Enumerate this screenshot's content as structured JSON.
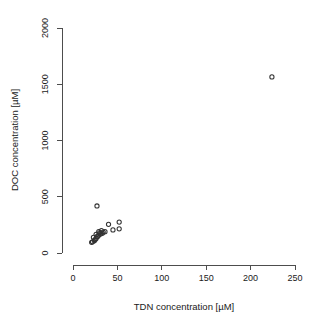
{
  "figure": {
    "background_color": "#ffffff",
    "point_color": "#333333",
    "axis_color": "#4d4d4d",
    "text_color": "#1a1a1a"
  },
  "chart_data": {
    "type": "scatter",
    "title": "",
    "subtitle": "",
    "xlabel": "TDN concentration [µM]",
    "ylabel": "DOC concentration [µM]",
    "xlim": [
      0,
      250
    ],
    "ylim": [
      0,
      2000
    ],
    "xticks": [
      0,
      50,
      100,
      150,
      200,
      250
    ],
    "yticks": [
      0,
      500,
      1000,
      1500,
      2000
    ],
    "xticklabels": [
      "0",
      "50",
      "100",
      "150",
      "200",
      "250"
    ],
    "yticklabels": [
      "0",
      "500",
      "1000",
      "1500",
      "2000"
    ],
    "grid": false,
    "legend": null,
    "marker": "open-circle",
    "marker_size": 4.2,
    "annotations": [],
    "series": [
      {
        "name": "samples",
        "x": [
          224,
          27,
          52,
          52,
          45,
          40,
          36,
          34,
          33,
          32,
          31,
          30,
          29,
          29,
          28,
          27,
          26,
          26,
          25,
          24,
          23,
          22,
          21
        ],
        "y": [
          1565,
          418,
          275,
          215,
          205,
          255,
          190,
          185,
          175,
          200,
          170,
          180,
          160,
          190,
          150,
          145,
          130,
          165,
          120,
          110,
          140,
          100,
          95
        ]
      }
    ]
  }
}
